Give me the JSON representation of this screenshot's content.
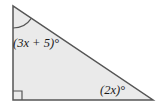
{
  "figure": {
    "shape": "right-triangle",
    "fill_color": "#eaeaea",
    "stroke_color": "#555555",
    "label_color": "#1a1a1a",
    "angles": {
      "top_angle_label": "(3x + 5)°",
      "bottom_right_angle_label": "(2x)°",
      "bottom_left_angle": "right-angle (square marker)"
    }
  }
}
